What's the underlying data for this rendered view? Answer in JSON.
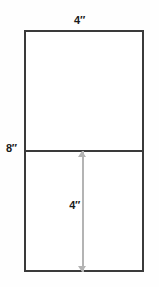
{
  "diagram": {
    "type": "geometry-dimension-drawing",
    "shape": "rectangle",
    "unit": "inch",
    "unit_mark": "″",
    "colors": {
      "background": "#fefefe",
      "shape_fill": "#ffffff",
      "shape_stroke": "#3a3a3a",
      "divider_stroke": "#3a3a3a",
      "dimension_line": "#b4b4b4",
      "label_text": "#1a1a1a"
    },
    "labels": {
      "top_width": "4″",
      "left_height": "8″",
      "inner_half_height": "4″"
    },
    "measurements": {
      "width": 4,
      "height": 8,
      "half_height": 4
    }
  },
  "chart_data": {
    "type": "diagram",
    "shapes": [
      {
        "name": "outer-rectangle",
        "kind": "rectangle",
        "width_label": "4″",
        "height_label": "8″",
        "width_value": 4,
        "height_value": 8
      },
      {
        "name": "horizontal-divider",
        "kind": "line",
        "orientation": "horizontal",
        "position": "midpoint of height"
      },
      {
        "name": "lower-half-dimension",
        "kind": "double-headed-arrow",
        "orientation": "vertical",
        "label": "4″",
        "value": 4
      }
    ],
    "annotations": [
      "4″",
      "8″",
      "4″"
    ]
  }
}
